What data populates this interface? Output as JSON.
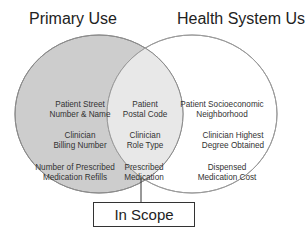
{
  "diagram": {
    "type": "venn",
    "sets": [
      {
        "name": "Primary Use",
        "fill": "#cfcfcf",
        "stroke": "#888888"
      },
      {
        "name": "Health System Use",
        "fill": "#ffffff",
        "stroke": "#888888"
      }
    ],
    "left_only": [
      "Patient Street\nNumber & Name",
      "Clinician\nBilling Number",
      "Number of Prescribed\nMedication Refills"
    ],
    "overlap": [
      "Patient\nPostal Code",
      "Clinician\nRole Type",
      "Prescribed\nMedication"
    ],
    "right_only": [
      "Patient Socioeconomic\nNeighborhood",
      "Clinician Highest\nDegree Obtained",
      "Dispensed\nMedication Cost"
    ],
    "callout": {
      "label": "In Scope",
      "points_to": "overlap"
    }
  },
  "titles": {
    "left": "Primary Use",
    "right": "Health System Use"
  },
  "left": {
    "item0": {
      "l1": "Patient Street",
      "l2": "Number & Name"
    },
    "item1": {
      "l1": "Clinician",
      "l2": "Billing Number"
    },
    "item2": {
      "l1": "Number of Prescribed",
      "l2": "Medication Refills"
    }
  },
  "mid": {
    "item0": {
      "l1": "Patient",
      "l2": "Postal Code"
    },
    "item1": {
      "l1": "Clinician",
      "l2": "Role Type"
    },
    "item2": {
      "l1": "Prescribed",
      "l2": "Medication"
    }
  },
  "right": {
    "item0": {
      "l1": "Patient Socioeconomic",
      "l2": "Neighborhood"
    },
    "item1": {
      "l1": "Clinician Highest",
      "l2": "Degree Obtained"
    },
    "item2": {
      "l1": "Dispensed",
      "l2": "Medication Cost"
    }
  },
  "callout": {
    "label": "In Scope"
  }
}
